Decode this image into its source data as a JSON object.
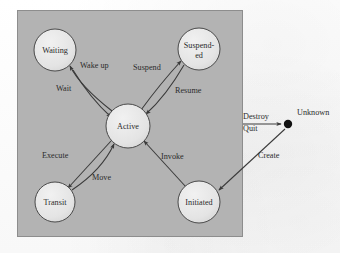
{
  "figure": {
    "type": "state-transition-diagram",
    "panel": {
      "fill": "#b3b3b3",
      "border": "#8f8f8f",
      "x": 17,
      "y": 10,
      "width": 226,
      "height": 227
    },
    "colors": {
      "background": "#fdfdfd",
      "panel_gray": "#b3b3b3",
      "node_fill": "#e8e8e8",
      "node_stroke": "#4a4a4a",
      "edge_stroke": "#3a3a3a",
      "text": "#2b2b2b",
      "terminal_dot": "#111111"
    },
    "nodes": [
      {
        "id": "waiting",
        "label": "Waiting",
        "lines": [
          "Waiting"
        ],
        "cx": 55,
        "cy": 50,
        "r": 21,
        "inside_panel": true
      },
      {
        "id": "suspended",
        "label": "Suspend-ed",
        "lines": [
          "Suspend-",
          "ed"
        ],
        "cx": 199,
        "cy": 49,
        "r": 21,
        "inside_panel": true
      },
      {
        "id": "active",
        "label": "Active",
        "lines": [
          "Active"
        ],
        "cx": 128,
        "cy": 126,
        "r": 22,
        "inside_panel": true
      },
      {
        "id": "transit",
        "label": "Transit",
        "lines": [
          "Transit"
        ],
        "cx": 55,
        "cy": 202,
        "r": 20,
        "inside_panel": true
      },
      {
        "id": "initiated",
        "label": "Initiated",
        "lines": [
          "Initiated"
        ],
        "cx": 199,
        "cy": 202,
        "r": 21,
        "inside_panel": true
      }
    ],
    "terminal": {
      "id": "unknown",
      "label": "Unknown",
      "cx": 288,
      "cy": 124,
      "r": 4.2,
      "label_x": 297,
      "label_y": 115
    },
    "edges": [
      {
        "id": "wait",
        "label": "Wait",
        "from": "active",
        "to": "waiting",
        "label_x": 56,
        "label_y": 91
      },
      {
        "id": "wake-up",
        "label": "Wake up",
        "from": "waiting",
        "to": "active",
        "label_x": 80,
        "label_y": 68
      },
      {
        "id": "suspend",
        "label": "Suspend",
        "from": "active",
        "to": "suspended",
        "label_x": 133,
        "label_y": 70
      },
      {
        "id": "resume",
        "label": "Resume",
        "from": "suspended",
        "to": "active",
        "label_x": 175,
        "label_y": 93
      },
      {
        "id": "execute",
        "label": "Execute",
        "from": "active",
        "to": "transit",
        "label_x": 42,
        "label_y": 158
      },
      {
        "id": "move",
        "label": "Move",
        "from": "transit",
        "to": "active",
        "label_x": 92,
        "label_y": 180
      },
      {
        "id": "invoke",
        "label": "Invoke",
        "from": "initiated",
        "to": "active",
        "label_x": 161,
        "label_y": 159
      },
      {
        "id": "destroy",
        "label": "Destroy",
        "from": "panel",
        "to": "unknown",
        "label_x": 243,
        "label_y": 119
      },
      {
        "id": "quit",
        "label": "Quit",
        "from": "panel",
        "to": "unknown",
        "label_x": 243,
        "label_y": 131
      },
      {
        "id": "create",
        "label": "Create",
        "from": "unknown",
        "to": "initiated",
        "label_x": 258,
        "label_y": 158
      }
    ]
  }
}
